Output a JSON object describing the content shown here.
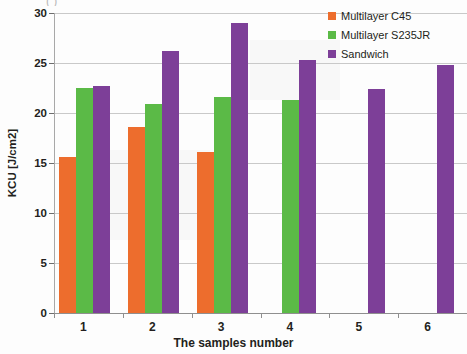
{
  "chart_data": {
    "type": "bar",
    "title": "",
    "xlabel": "The samples number",
    "ylabel": "KCU [J/cm2]",
    "categories": [
      "1",
      "2",
      "3",
      "4",
      "5",
      "6"
    ],
    "series": [
      {
        "name": "Multilayer C45",
        "color": "#ED6D2D",
        "values": [
          15.6,
          18.6,
          16.1,
          null,
          null,
          null
        ]
      },
      {
        "name": "Multilayer S235JR",
        "color": "#5BBA47",
        "values": [
          22.5,
          20.9,
          21.6,
          21.3,
          null,
          null
        ]
      },
      {
        "name": "Sandwich",
        "color": "#7D3F98",
        "values": [
          22.7,
          26.2,
          29.0,
          25.3,
          22.4,
          24.8
        ]
      }
    ],
    "ylim": [
      0,
      30
    ],
    "ytick_values": [
      0,
      5,
      10,
      15,
      20,
      25,
      30
    ],
    "ytick_labels": [
      "0",
      "5",
      "10",
      "15",
      "20",
      "25",
      "30"
    ],
    "grid": true,
    "legend_position": "top-right"
  },
  "artifacts": {
    "top_cropped_text": "(                                )"
  }
}
